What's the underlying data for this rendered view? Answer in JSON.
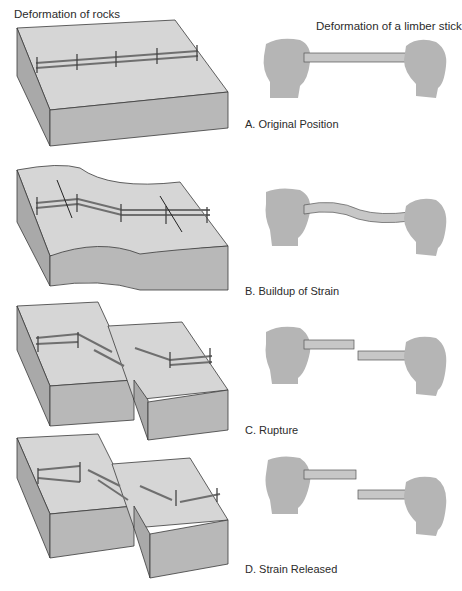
{
  "figure": {
    "left_heading": "Deformation of rocks",
    "right_heading": "Deformation of a limber stick",
    "stages": [
      {
        "id": "A",
        "label": "A. Original Position"
      },
      {
        "id": "B",
        "label": "B. Buildup of Strain"
      },
      {
        "id": "C",
        "label": "C. Rupture"
      },
      {
        "id": "D",
        "label": "D. Strain Released"
      }
    ]
  },
  "colors": {
    "rock_top": "#d6d6d6",
    "rock_side": "#a9a9a9",
    "rock_front": "#b8b8b8",
    "outline": "#3a3a3a",
    "hand": "#b5b5b5",
    "stick": "#c7c7c7",
    "fence": "#7a7a7a"
  }
}
